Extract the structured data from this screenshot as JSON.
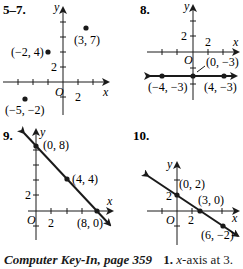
{
  "graphs": [
    {
      "number": "5–7.",
      "points": [
        {
          "label": "(3, 7)"
        },
        {
          "label": "(−2, 4)"
        },
        {
          "label": "(−5, −2)"
        }
      ],
      "tick_label_x": "2",
      "tick_label_y": "2",
      "origin": "O",
      "x_axis": "x",
      "y_axis": "y"
    },
    {
      "number": "8.",
      "points": [
        {
          "label": "(0, −3)"
        },
        {
          "label": "(−4, −3)"
        },
        {
          "label": "(4, −3)"
        }
      ],
      "tick_label_x": "2",
      "tick_label_y": "2",
      "origin": "O",
      "x_axis": "x",
      "y_axis": "y"
    },
    {
      "number": "9.",
      "points": [
        {
          "label": "(0, 8)"
        },
        {
          "label": "(4, 4)"
        },
        {
          "label": "(8, 0)"
        }
      ],
      "tick_label_x": "2",
      "tick_label_y": "2",
      "origin": "O",
      "x_axis": "x",
      "y_axis": "y"
    },
    {
      "number": "10.",
      "points": [
        {
          "label": "(0, 2)"
        },
        {
          "label": "(3, 0)"
        },
        {
          "label": "(6, −2)"
        }
      ],
      "tick_label_x": "2",
      "tick_label_y": "2",
      "origin": "O",
      "x_axis": "x",
      "y_axis": "y"
    }
  ],
  "footer": {
    "section": "Computer Key-In, page 359",
    "item_number": "1.",
    "item_var": "x",
    "item_text": "-axis at 3."
  }
}
